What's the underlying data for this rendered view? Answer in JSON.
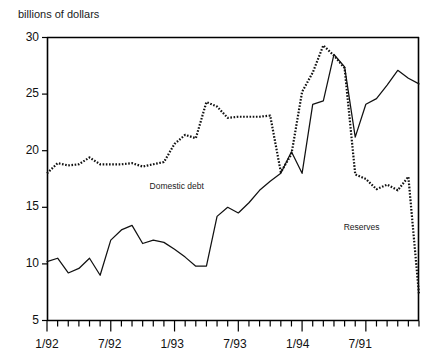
{
  "chart_data": {
    "type": "line",
    "title": "",
    "ylabel": "billions of dollars",
    "xlabel": "",
    "ylim": [
      5,
      30
    ],
    "yticks": [
      5,
      10,
      15,
      20,
      25,
      30
    ],
    "grid": false,
    "legend_position": "inline-annotations",
    "xtick_labels": [
      "1/92",
      "7/92",
      "1/93",
      "7/93",
      "1/94",
      "7/91"
    ],
    "xtick_positions": [
      0,
      6,
      12,
      18,
      24,
      30
    ],
    "minor_ticks": "monthly",
    "x_count": 36,
    "series": [
      {
        "name": "Domestic debt",
        "style": "solid",
        "label_x_index": 12.2,
        "label_value": 16.6,
        "values": [
          10.2,
          10.5,
          9.2,
          9.6,
          10.5,
          9.0,
          12.1,
          13.0,
          13.4,
          11.8,
          12.1,
          11.9,
          11.3,
          10.6,
          9.8,
          9.8,
          14.2,
          15.0,
          14.5,
          15.4,
          16.5,
          17.3,
          18.0,
          19.9,
          18.0,
          24.1,
          24.4,
          28.5,
          27.4,
          21.2,
          24.1,
          24.6,
          25.8,
          27.1,
          26.4,
          25.9
        ]
      },
      {
        "name": "Reserves",
        "style": "dotted",
        "label_x_index": 29.6,
        "label_value": 13.0,
        "values": [
          18.0,
          18.9,
          18.7,
          18.8,
          19.4,
          18.8,
          18.8,
          18.8,
          18.9,
          18.6,
          18.8,
          19.0,
          20.6,
          21.4,
          21.1,
          24.3,
          23.9,
          22.9,
          23.0,
          23.0,
          23.0,
          23.1,
          18.1,
          19.7,
          25.2,
          26.9,
          29.3,
          28.4,
          27.3,
          17.9,
          17.5,
          16.6,
          17.0,
          16.5,
          17.7,
          7.3
        ]
      }
    ]
  },
  "annotations": {
    "domestic_debt_label": "Domestic debt",
    "reserves_label": "Reserves"
  }
}
